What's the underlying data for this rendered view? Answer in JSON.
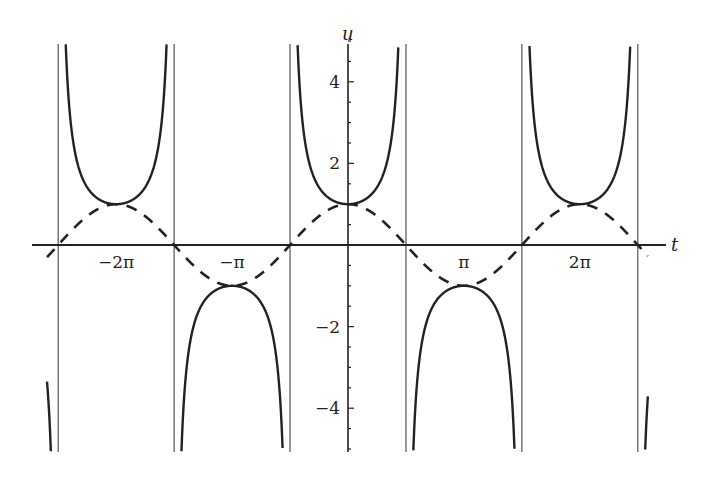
{
  "chart_data": {
    "type": "line",
    "title": "",
    "xlabel": "t",
    "ylabel": "u",
    "xlim": [
      -8.35,
      8.6
    ],
    "ylim": [
      -5,
      5
    ],
    "grid": false,
    "legend": null,
    "x_ticks": [
      {
        "value": -6.2832,
        "label": "-2π"
      },
      {
        "value": -3.1416,
        "label": "-π"
      },
      {
        "value": 3.1416,
        "label": "π"
      },
      {
        "value": 6.2832,
        "label": "2π"
      }
    ],
    "y_ticks": [
      {
        "value": 4,
        "label": "4"
      },
      {
        "value": 2,
        "label": "2"
      },
      {
        "value": -2,
        "label": "-2"
      },
      {
        "value": -4,
        "label": "-4"
      }
    ],
    "asymptotes": [
      -7.854,
      -4.712,
      -1.5708,
      1.5708,
      4.712,
      7.854
    ],
    "series": [
      {
        "name": "u = sec t",
        "style": "solid",
        "color": "#222222",
        "formula": "1/cos(t)",
        "sample_points": [
          {
            "t": -6.2832,
            "u": 1
          },
          {
            "t": -3.1416,
            "u": -1
          },
          {
            "t": 0,
            "u": 1
          },
          {
            "t": 3.1416,
            "u": -1
          },
          {
            "t": 6.2832,
            "u": 1
          },
          {
            "t": 1.0472,
            "u": 2
          },
          {
            "t": 1.3181,
            "u": 4
          },
          {
            "t": -1.0472,
            "u": 2
          }
        ]
      },
      {
        "name": "u = cos t",
        "style": "dashed",
        "color": "#222222",
        "formula": "cos(t)",
        "sample_points": [
          {
            "t": -7.854,
            "u": 0
          },
          {
            "t": -6.2832,
            "u": 1
          },
          {
            "t": -4.712,
            "u": 0
          },
          {
            "t": -3.1416,
            "u": -1
          },
          {
            "t": -1.5708,
            "u": 0
          },
          {
            "t": 0,
            "u": 1
          },
          {
            "t": 1.5708,
            "u": 0
          },
          {
            "t": 3.1416,
            "u": -1
          },
          {
            "t": 4.712,
            "u": 0
          },
          {
            "t": 6.2832,
            "u": 1
          },
          {
            "t": 7.854,
            "u": 0
          }
        ]
      }
    ]
  },
  "layout": {
    "origin_px": [
      348,
      245
    ],
    "px_per_t": 36.9,
    "px_per_u": 40.8,
    "plot_top_px": 44,
    "plot_bottom_px": 452,
    "x_axis_left_px": 32,
    "x_axis_right_px": 666,
    "ink_color": "#222222",
    "asymptote_color": "#555555"
  }
}
